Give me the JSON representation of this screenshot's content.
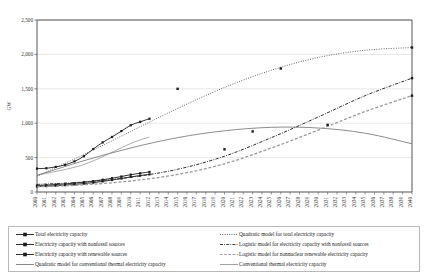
{
  "chart_data": {
    "type": "line",
    "title": "",
    "xlabel": "",
    "ylabel": "GW",
    "xlim": [
      2000,
      2040
    ],
    "ylim": [
      0,
      2500
    ],
    "yticks": [
      "0",
      "500",
      "1,000",
      "1,500",
      "2,000",
      "2,500"
    ],
    "ytick_values": [
      0,
      500,
      1000,
      1500,
      2000,
      2500
    ],
    "grid": "horizontal",
    "legend_position": "bottom",
    "xticks": [
      "2000",
      "2001",
      "2002",
      "2003",
      "2004",
      "2005",
      "2006",
      "2007",
      "2008",
      "2009",
      "2010",
      "2011",
      "2012",
      "2013",
      "2014",
      "2015",
      "2016",
      "2017",
      "2018",
      "2019",
      "2020",
      "2021",
      "2022",
      "2023",
      "2024",
      "2025",
      "2026",
      "2027",
      "2028",
      "2029",
      "2030",
      "2031",
      "2032",
      "2033",
      "2034",
      "2035",
      "2036",
      "2037",
      "2038",
      "2039",
      "2040"
    ],
    "series": [
      {
        "name": "Total electricity capacity",
        "style": "solid-marker",
        "color": "#1a1a1a",
        "x": [
          2000,
          2001,
          2002,
          2003,
          2004,
          2005,
          2006,
          2007,
          2008,
          2009,
          2010,
          2011,
          2012
        ],
        "values": [
          340,
          345,
          365,
          395,
          445,
          520,
          625,
          720,
          800,
          885,
          970,
          1020,
          1065
        ]
      },
      {
        "name": "Electricity capacity with nonfossil sources",
        "style": "solid-marker",
        "color": "#1a1a1a",
        "x": [
          2000,
          2001,
          2002,
          2003,
          2004,
          2005,
          2006,
          2007,
          2008,
          2009,
          2010,
          2011,
          2012
        ],
        "values": [
          95,
          100,
          108,
          118,
          128,
          142,
          158,
          178,
          200,
          225,
          252,
          272,
          292
        ]
      },
      {
        "name": "Electricity capacity with renewable sources",
        "style": "solid-marker",
        "color": "#1a1a1a",
        "x": [
          2000,
          2001,
          2002,
          2003,
          2004,
          2005,
          2006,
          2007,
          2008,
          2009,
          2010,
          2011,
          2012
        ],
        "values": [
          80,
          85,
          92,
          100,
          110,
          122,
          136,
          154,
          174,
          196,
          220,
          238,
          256
        ]
      },
      {
        "name": "Quadratic model for conventional thermal electricity capacity",
        "style": "solid",
        "color": "#6f6f6f",
        "x": [
          2000,
          2005,
          2010,
          2015,
          2020,
          2025,
          2030,
          2035,
          2040
        ],
        "values": [
          240,
          455,
          640,
          790,
          890,
          940,
          930,
          855,
          700
        ]
      },
      {
        "name": "Quadratic model for total electricity capacity",
        "style": "dotted",
        "color": "#3a3a3a",
        "x": [
          2000,
          2005,
          2010,
          2015,
          2020,
          2025,
          2030,
          2035,
          2040
        ],
        "values": [
          230,
          545,
          880,
          1215,
          1520,
          1770,
          1955,
          2060,
          2100
        ]
      },
      {
        "name": "Logistic model for electricity capacity with nonfossil sources",
        "style": "dashdot",
        "color": "#2d2d2d",
        "x": [
          2000,
          2005,
          2010,
          2015,
          2020,
          2025,
          2030,
          2035,
          2040
        ],
        "values": [
          110,
          145,
          215,
          330,
          520,
          790,
          1090,
          1400,
          1655
        ]
      },
      {
        "name": "Logistic model for nonnuclear renewable electricity capacity",
        "style": "dashed",
        "color": "#9a9a9a",
        "x": [
          2000,
          2005,
          2010,
          2015,
          2020,
          2025,
          2030,
          2035,
          2040
        ],
        "values": [
          75,
          105,
          160,
          255,
          410,
          640,
          900,
          1170,
          1400
        ]
      },
      {
        "name": "Conventional thermal electricity capacity",
        "style": "solid-thin",
        "color": "#8a8a8a",
        "x": [
          2000,
          2005,
          2010,
          2012
        ],
        "values": [
          245,
          400,
          705,
          800
        ]
      }
    ],
    "scatter_points": [
      {
        "x": 2015,
        "y": 1500
      },
      {
        "x": 2020,
        "y": 620
      },
      {
        "x": 2023,
        "y": 880
      },
      {
        "x": 2026,
        "y": 1795
      },
      {
        "x": 2031,
        "y": 975
      },
      {
        "x": 2040,
        "y": 2100
      },
      {
        "x": 2040,
        "y": 1655
      },
      {
        "x": 2040,
        "y": 1400
      }
    ]
  },
  "legend": {
    "left": [
      {
        "label": "Total electricity capacity",
        "key": "solid-marker"
      },
      {
        "label": "Electricity capacity with nonfossil sources",
        "key": "solid-marker"
      },
      {
        "label": "Electricity capacity with renewable sources",
        "key": "solid-marker"
      },
      {
        "label": "Quadratic model for conventional thermal electricity capacity",
        "key": "solid-gray"
      }
    ],
    "right": [
      {
        "label": "Quadratic model for total electricity capacity",
        "key": "dotted"
      },
      {
        "label": "Logistic model for electricity capacity with nonfossil sources",
        "key": "dashdot"
      },
      {
        "label": "Logistic model for nonnuclear renewable electricity capacity",
        "key": "dashed"
      },
      {
        "label": "Conventional thermal electricity capacity",
        "key": "solid-thin"
      }
    ]
  }
}
